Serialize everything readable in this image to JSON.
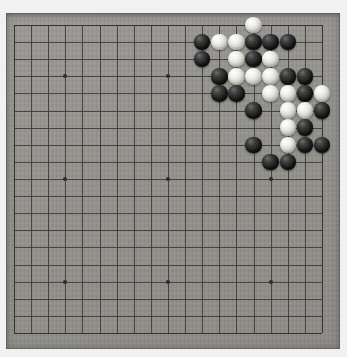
{
  "app": {
    "title": "Go board (Goban) photograph",
    "description": "19x19 Go board with a joseki fight in the upper right corner"
  },
  "board": {
    "size": 19,
    "origin_x": 14,
    "origin_y": 25,
    "spacing": 17.11,
    "slab_color": "#94928d",
    "line_color": "#3a3935",
    "background_color": "#f2f2f2",
    "star_point_color": "#2b2a27",
    "star_points": [
      {
        "col": 3,
        "row": 3
      },
      {
        "col": 9,
        "row": 3
      },
      {
        "col": 15,
        "row": 3
      },
      {
        "col": 3,
        "row": 9
      },
      {
        "col": 9,
        "row": 9
      },
      {
        "col": 15,
        "row": 9
      },
      {
        "col": 3,
        "row": 15
      },
      {
        "col": 9,
        "row": 15
      },
      {
        "col": 15,
        "row": 15
      }
    ]
  },
  "stones": {
    "black_color": "#141414",
    "white_color": "#ededea",
    "radius": 8.2,
    "list": [
      {
        "col": 14,
        "row": 0,
        "color": "white"
      },
      {
        "col": 11,
        "row": 1,
        "color": "black"
      },
      {
        "col": 12,
        "row": 1,
        "color": "white"
      },
      {
        "col": 13,
        "row": 1,
        "color": "white"
      },
      {
        "col": 14,
        "row": 1,
        "color": "black"
      },
      {
        "col": 15,
        "row": 1,
        "color": "black"
      },
      {
        "col": 16,
        "row": 1,
        "color": "black"
      },
      {
        "col": 11,
        "row": 2,
        "color": "black"
      },
      {
        "col": 13,
        "row": 2,
        "color": "white"
      },
      {
        "col": 14,
        "row": 2,
        "color": "black"
      },
      {
        "col": 15,
        "row": 2,
        "color": "white"
      },
      {
        "col": 12,
        "row": 3,
        "color": "black"
      },
      {
        "col": 13,
        "row": 3,
        "color": "white"
      },
      {
        "col": 14,
        "row": 3,
        "color": "white"
      },
      {
        "col": 15,
        "row": 3,
        "color": "white"
      },
      {
        "col": 16,
        "row": 3,
        "color": "black"
      },
      {
        "col": 17,
        "row": 3,
        "color": "black"
      },
      {
        "col": 12,
        "row": 4,
        "color": "black"
      },
      {
        "col": 13,
        "row": 4,
        "color": "black"
      },
      {
        "col": 15,
        "row": 4,
        "color": "white"
      },
      {
        "col": 16,
        "row": 4,
        "color": "white"
      },
      {
        "col": 17,
        "row": 4,
        "color": "black"
      },
      {
        "col": 18,
        "row": 4,
        "color": "white"
      },
      {
        "col": 14,
        "row": 5,
        "color": "black"
      },
      {
        "col": 16,
        "row": 5,
        "color": "white"
      },
      {
        "col": 17,
        "row": 5,
        "color": "white"
      },
      {
        "col": 18,
        "row": 5,
        "color": "black"
      },
      {
        "col": 16,
        "row": 6,
        "color": "white"
      },
      {
        "col": 17,
        "row": 6,
        "color": "black"
      },
      {
        "col": 14,
        "row": 7,
        "color": "black"
      },
      {
        "col": 16,
        "row": 7,
        "color": "white"
      },
      {
        "col": 17,
        "row": 7,
        "color": "black"
      },
      {
        "col": 18,
        "row": 7,
        "color": "black"
      },
      {
        "col": 15,
        "row": 8,
        "color": "black"
      },
      {
        "col": 16,
        "row": 8,
        "color": "black"
      }
    ]
  }
}
